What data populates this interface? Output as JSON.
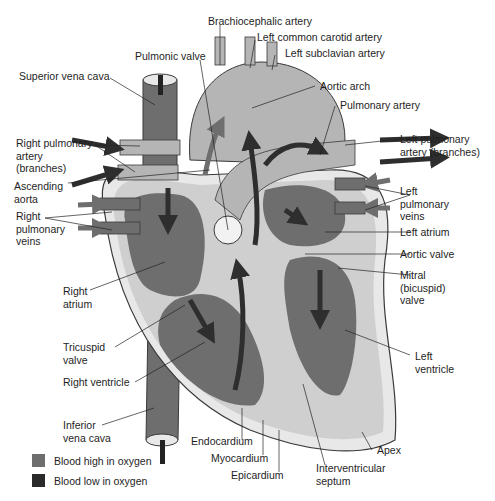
{
  "diagram": {
    "colors": {
      "oxygen_high": "#7a7a7a",
      "oxygen_low": "#2e2e2e",
      "wall": "#cfcfcf",
      "outer": "#e8e8e8",
      "outline": "#3a3a3a"
    },
    "labels": {
      "brachiocephalic_artery": "Brachiocephalic artery",
      "left_common_carotid_artery": "Left common carotid artery",
      "left_subclavian_artery": "Left subclavian artery",
      "pulmonic_valve": "Pulmonic valve",
      "superior_vena_cava": "Superior vena cava",
      "aortic_arch": "Aortic arch",
      "pulmonary_artery": "Pulmonary artery",
      "right_pulmonary_artery": [
        "Right pulmonary",
        "artery",
        "(branches)"
      ],
      "left_pulmonary_artery": [
        "Left pulmonary",
        "artery (branches)"
      ],
      "ascending_aorta": [
        "Ascending",
        "aorta"
      ],
      "right_pulmonary_veins": [
        "Right",
        "pulmonary",
        "veins"
      ],
      "left_pulmonary_veins": [
        "Left",
        "pulmonary",
        "veins"
      ],
      "left_atrium": "Left atrium",
      "aortic_valve": "Aortic valve",
      "mitral_valve": [
        "Mitral",
        "(bicuspid)",
        "valve"
      ],
      "right_atrium": [
        "Right",
        "atrium"
      ],
      "tricuspid_valve": [
        "Tricuspid",
        "valve"
      ],
      "right_ventricle": "Right ventricle",
      "left_ventricle": [
        "Left",
        "ventricle"
      ],
      "inferior_vena_cava": [
        "Inferior",
        "vena cava"
      ],
      "endocardium": "Endocardium",
      "myocardium": "Myocardium",
      "epicardium": "Epicardium",
      "interventricular_septum": [
        "Interventricular",
        "septum"
      ],
      "apex": "Apex"
    },
    "legend": [
      {
        "label": "Blood high in oxygen",
        "color": "#6e6e6e"
      },
      {
        "label": "Blood low in oxygen",
        "color": "#2a2a2a"
      }
    ]
  }
}
